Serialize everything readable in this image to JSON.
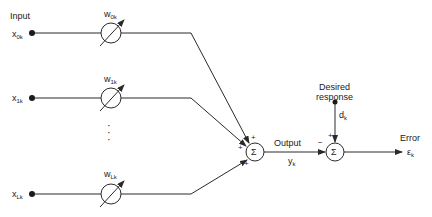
{
  "diagram": {
    "type": "adaptive linear combiner block diagram",
    "input_label": "Input",
    "inputs": [
      {
        "symbol": "x",
        "subscript": "0k",
        "weight_symbol": "w",
        "weight_subscript": "0k"
      },
      {
        "symbol": "x",
        "subscript": "1k",
        "weight_symbol": "w",
        "weight_subscript": "1k"
      },
      {
        "symbol": "x",
        "subscript": "Lk",
        "weight_symbol": "w",
        "weight_subscript": "Lk"
      }
    ],
    "ellipsis": "⋮",
    "sum_symbol": "Σ",
    "sum1_signs": [
      "+",
      "+",
      "+"
    ],
    "output_label": "Output",
    "output_symbol": "y",
    "output_subscript": "k",
    "desired_label_1": "Desired",
    "desired_label_2": "response",
    "desired_symbol": "d",
    "desired_subscript": "k",
    "sum2_plus": "+",
    "sum2_minus": "−",
    "error_label": "Error",
    "error_symbol": "ε",
    "error_subscript": "k",
    "colors": {
      "line": "#2a2a2a",
      "text": "#222222",
      "background": "#ffffff"
    }
  }
}
